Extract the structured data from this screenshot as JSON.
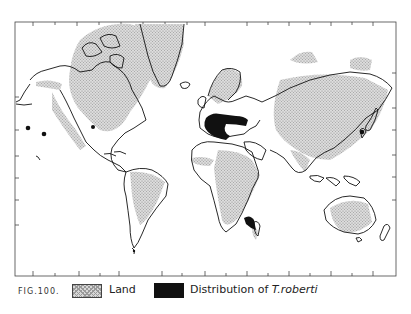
{
  "figure": {
    "label": "FIG.100.",
    "title": "Distribution of T.roberti"
  },
  "legend": {
    "items": [
      {
        "label": "Land",
        "swatch": "stippled-gray"
      },
      {
        "label_prefix": "Distribution of ",
        "label_species": "T.roberti",
        "swatch": "solid-black"
      }
    ]
  },
  "map": {
    "projection": "Mercator world map",
    "frame": {
      "x": 15,
      "y": 22,
      "width": 381,
      "height": 254
    },
    "colors": {
      "land_fill": "#d0d0d0",
      "coastline": "#111111",
      "distribution": "#111111",
      "background": "#ffffff"
    },
    "distribution_regions": [
      "Southern Europe / Mediterranean coast (Iberia, France, Italy, Balkans, Black Sea region)",
      "East Africa coast (Kenya/Tanzania)",
      "Point: Western North America (California coast)",
      "Point: Western USA interior",
      "Point: Hawaii/Pacific (west of Americas)",
      "Point: Japan / NW Pacific"
    ]
  }
}
